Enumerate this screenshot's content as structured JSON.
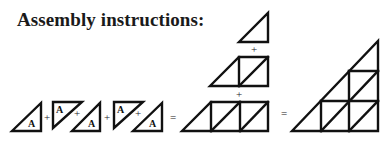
{
  "title": "Assembly instructions:",
  "piece_label": "A",
  "operators": {
    "plus": "+",
    "equals": "="
  },
  "stroke_color": "#111111",
  "background_color": "#ffffff",
  "diagram": {
    "row1_pieces": [
      {
        "orientation": "lower-right",
        "label": "A"
      },
      {
        "orientation": "upper-left",
        "label": "A"
      },
      {
        "orientation": "lower-right",
        "label": "A"
      },
      {
        "orientation": "upper-left",
        "label": "A"
      },
      {
        "orientation": "lower-right",
        "label": "A"
      }
    ],
    "stack_rows": [
      "1 triangle",
      "3 triangles",
      "5 triangles"
    ],
    "result": "large right triangle of 9 small triangles"
  }
}
